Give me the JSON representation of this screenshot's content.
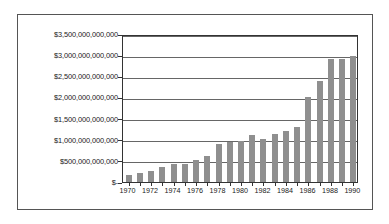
{
  "chart_data": {
    "type": "bar",
    "title": "",
    "xlabel": "",
    "ylabel": "",
    "ylim": [
      0,
      3500000000000
    ],
    "ytick_values": [
      0,
      500000000000,
      1000000000000,
      1500000000000,
      2000000000000,
      2500000000000,
      3000000000000,
      3500000000000
    ],
    "ytick_labels": [
      "$-",
      "$500,000,000,000",
      "$1,000,000,000,000",
      "$1,500,000,000,000",
      "$2,000,000,000,000",
      "$2,500,000,000,000",
      "$3,000,000,000,000",
      "$3,500,000,000,000"
    ],
    "grid": true,
    "legend": "none",
    "bar_color": "#8f8f8f",
    "categories": [
      "1970",
      "1971",
      "1972",
      "1973",
      "1974",
      "1975",
      "1976",
      "1977",
      "1978",
      "1979",
      "1980",
      "1981",
      "1982",
      "1983",
      "1984",
      "1985",
      "1986",
      "1987",
      "1988",
      "1989",
      "1990"
    ],
    "xtick_labels": [
      "1970",
      "1972",
      "1974",
      "1976",
      "1978",
      "1980",
      "1982",
      "1984",
      "1986",
      "1988",
      "1990"
    ],
    "values": [
      170000000000,
      205000000000,
      265000000000,
      355000000000,
      415000000000,
      435000000000,
      520000000000,
      620000000000,
      900000000000,
      955000000000,
      960000000000,
      1120000000000,
      1010000000000,
      1130000000000,
      1215000000000,
      1290000000000,
      2000000000000,
      2400000000000,
      2920000000000,
      2920000000000,
      2990000000000
    ]
  }
}
